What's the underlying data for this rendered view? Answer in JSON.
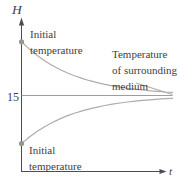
{
  "figure": {
    "y_axis_title": "H",
    "x_axis_title": "t",
    "asymptote_tick": "15",
    "labels": {
      "upper_initial": [
        "Initial",
        "temperature"
      ],
      "surrounding": [
        "Temperature",
        "of surrounding",
        "medium"
      ],
      "lower_initial": [
        "Initial",
        "temperature"
      ]
    },
    "colors": {
      "background": "#ffffff",
      "axis": "#4d4d4d",
      "text": "#3e3e3e",
      "curve": "#b2aba5",
      "asymptote": "#9d9d9d",
      "dot": "#9b958f"
    }
  },
  "chart_data": {
    "type": "line",
    "title": "",
    "xlabel": "t",
    "ylabel": "H",
    "xlim": [
      0,
      1
    ],
    "ylim": [
      0,
      30
    ],
    "grid": false,
    "legend": "none",
    "asymptote": {
      "H": 15,
      "label": "Temperature of surrounding medium"
    },
    "x": [
      0,
      0.05,
      0.1,
      0.15,
      0.2,
      0.25,
      0.3,
      0.35,
      0.4,
      0.45,
      0.5,
      0.55,
      0.6,
      0.65,
      0.7,
      0.75,
      0.8,
      0.85,
      0.9,
      0.95,
      1
    ],
    "series": [
      {
        "name": "Initial temperature (cooling from above)",
        "start_marker": true,
        "values": [
          25.6,
          24.19,
          22.97,
          21.9,
          20.99,
          20.19,
          19.5,
          18.9,
          18.38,
          17.93,
          17.54,
          17.2,
          16.91,
          16.65,
          16.43,
          16.24,
          16.08,
          15.93,
          15.81,
          15.7,
          15.61
        ]
      },
      {
        "name": "Initial temperature (warming from below)",
        "start_marker": true,
        "values": [
          5.5,
          6.76,
          7.86,
          8.81,
          9.64,
          10.35,
          10.97,
          11.5,
          11.97,
          12.37,
          12.72,
          13.03,
          13.29,
          13.52,
          13.71,
          13.89,
          14.03,
          14.16,
          14.27,
          14.37,
          14.45
        ]
      }
    ]
  }
}
